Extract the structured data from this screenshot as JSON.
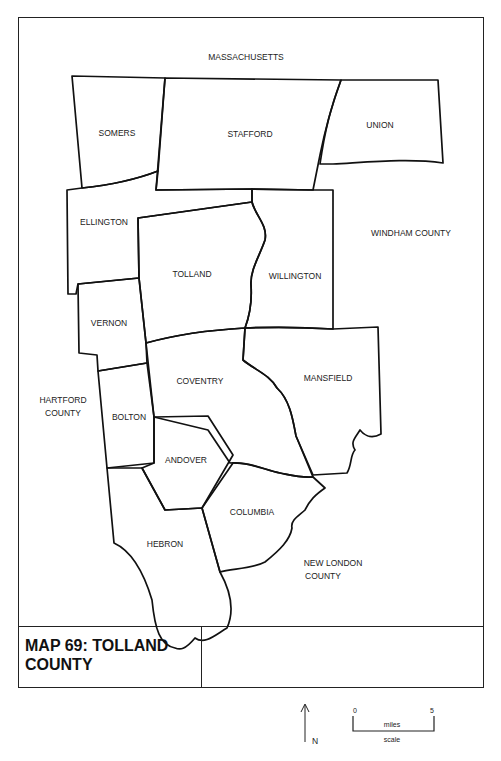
{
  "map": {
    "title": "MAP 69: TOLLAND\nCOUNTY",
    "surrounding_regions": {
      "north": "MASSACHUSETTS",
      "east": "WINDHAM COUNTY",
      "west_line1": "HARTFORD",
      "west_line2": "COUNTY",
      "south_line1": "NEW LONDON",
      "south_line2": "COUNTY"
    },
    "towns": [
      "SOMERS",
      "STAFFORD",
      "UNION",
      "ELLINGTON",
      "TOLLAND",
      "WILLINGTON",
      "VERNON",
      "COVENTRY",
      "MANSFIELD",
      "BOLTON",
      "ANDOVER",
      "COLUMBIA",
      "HEBRON"
    ],
    "north_arrow_label": "N",
    "scale": {
      "start": "0",
      "end": "5",
      "unit": "miles",
      "caption": "scale"
    }
  }
}
